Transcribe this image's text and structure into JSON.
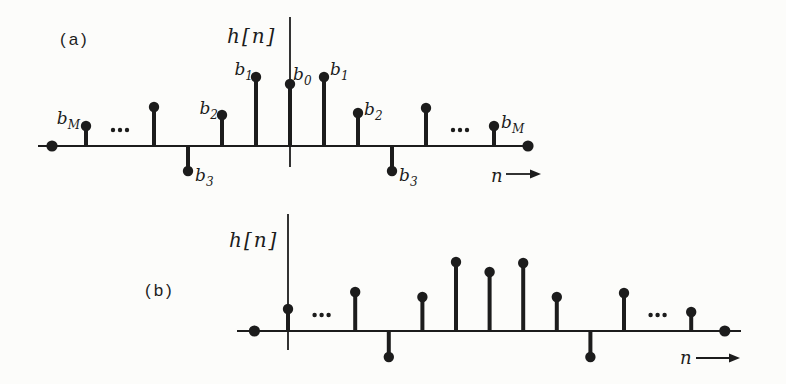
{
  "figure": {
    "background": "#fcfcfa",
    "ink": "#1c1c1c"
  },
  "chart_data": [
    {
      "type": "stem",
      "panel": "(a)",
      "ylabel": "h[n]",
      "xlabel": "n",
      "axes": {
        "x_start": 38,
        "x_end": 532,
        "baseline_y": 146,
        "origin_x": 290,
        "yaxis_top": 17,
        "yaxis_bottom": 167,
        "spacing": 34,
        "grid": false
      },
      "labels_pos": {
        "panel_x": 60,
        "panel_y": 45,
        "ylabel_x": 227,
        "ylabel_y": 43,
        "xlabel_x": 491,
        "xlabel_y": 182,
        "arrow_x1": 506,
        "arrow_x2": 531,
        "arrow_y": 174
      },
      "stems": [
        {
          "n": -7,
          "value": 0
        },
        {
          "n": -6,
          "value": 20,
          "label": "b_M",
          "anchor": "end",
          "dx": -6,
          "dy": -2
        },
        {
          "n": -5,
          "ellipsis": true
        },
        {
          "n": -4,
          "value": 39
        },
        {
          "n": -3,
          "value": -25,
          "label": "b_3",
          "anchor": "start",
          "dx": 7,
          "dy": 10
        },
        {
          "n": -2,
          "value": 31,
          "label": "b_2",
          "anchor": "end",
          "dx": -4,
          "dy": -1
        },
        {
          "n": -1,
          "value": 69,
          "label": "b_1",
          "anchor": "end",
          "dx": -3,
          "dy": -2
        },
        {
          "n": 0,
          "value": 62,
          "label": "b_0",
          "anchor": "start",
          "dx": 3,
          "dy": -4
        },
        {
          "n": 1,
          "value": 69,
          "label": "b_1",
          "anchor": "start",
          "dx": 6,
          "dy": -2
        },
        {
          "n": 2,
          "value": 33,
          "label": "b_2",
          "anchor": "start",
          "dx": 6,
          "dy": 2
        },
        {
          "n": 3,
          "value": -25,
          "label": "b_3",
          "anchor": "start",
          "dx": 7,
          "dy": 10
        },
        {
          "n": 4,
          "value": 38
        },
        {
          "n": 5,
          "ellipsis": true
        },
        {
          "n": 6,
          "value": 20,
          "label": "b_M",
          "anchor": "start",
          "dx": 7,
          "dy": 2
        },
        {
          "n": 7,
          "value": 0
        }
      ]
    },
    {
      "type": "stem",
      "panel": "(b)",
      "ylabel": "h[n]",
      "xlabel": "n",
      "axes": {
        "x_start": 237,
        "x_end": 741,
        "baseline_y": 331,
        "origin_x": 288,
        "yaxis_top": 214,
        "yaxis_bottom": 350,
        "spacing": 33.6,
        "grid": false
      },
      "labels_pos": {
        "panel_x": 145,
        "panel_y": 296,
        "ylabel_x": 229,
        "ylabel_y": 247,
        "xlabel_x": 680,
        "xlabel_y": 364,
        "arrow_x1": 696,
        "arrow_x2": 730,
        "arrow_y": 358
      },
      "stems": [
        {
          "n": -1,
          "value": 0
        },
        {
          "n": 0,
          "value": 22
        },
        {
          "n": 1,
          "ellipsis": true
        },
        {
          "n": 2,
          "value": 39
        },
        {
          "n": 3,
          "value": -26
        },
        {
          "n": 4,
          "value": 34
        },
        {
          "n": 5,
          "value": 69
        },
        {
          "n": 6,
          "value": 59
        },
        {
          "n": 7,
          "value": 68
        },
        {
          "n": 8,
          "value": 34
        },
        {
          "n": 9,
          "value": -26
        },
        {
          "n": 10,
          "value": 38
        },
        {
          "n": 11,
          "ellipsis": true
        },
        {
          "n": 12,
          "value": 19
        },
        {
          "n": 13,
          "value": 0
        }
      ]
    }
  ]
}
